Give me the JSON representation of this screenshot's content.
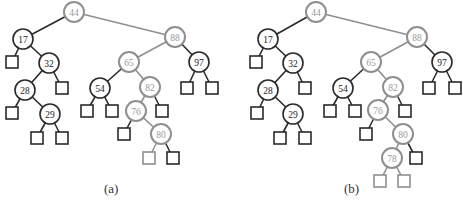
{
  "colors": {
    "dark": "#2a2a2a",
    "highlight": "#8f8f8f",
    "text_dark": "#222222",
    "text_highlight": "#9a9a9a"
  },
  "trees": [
    {
      "caption": "(a)",
      "caption_pos": [
        113,
        190
      ],
      "nodes": [
        {
          "key": "44",
          "x": 74,
          "y": 12,
          "hl": true
        },
        {
          "key": "17",
          "x": 23,
          "y": 39,
          "hl": false
        },
        {
          "key": "32",
          "x": 49,
          "y": 63,
          "hl": false
        },
        {
          "key": "28",
          "x": 25,
          "y": 90,
          "hl": false
        },
        {
          "key": "29",
          "x": 50,
          "y": 114,
          "hl": false
        },
        {
          "key": "88",
          "x": 175,
          "y": 37,
          "hl": true
        },
        {
          "key": "65",
          "x": 129,
          "y": 62,
          "hl": true
        },
        {
          "key": "97",
          "x": 199,
          "y": 62,
          "hl": false
        },
        {
          "key": "54",
          "x": 100,
          "y": 88,
          "hl": false
        },
        {
          "key": "82",
          "x": 150,
          "y": 87,
          "hl": true
        },
        {
          "key": "76",
          "x": 136,
          "y": 111,
          "hl": true
        },
        {
          "key": "80",
          "x": 161,
          "y": 134,
          "hl": true
        }
      ],
      "edges": [
        [
          "44",
          "17",
          false
        ],
        [
          "44",
          "88",
          true
        ],
        [
          "17",
          "32",
          false
        ],
        [
          "32",
          "28",
          false
        ],
        [
          "28",
          "29",
          false
        ],
        [
          "88",
          "65",
          true
        ],
        [
          "88",
          "97",
          false
        ],
        [
          "65",
          "54",
          false
        ],
        [
          "65",
          "82",
          true
        ],
        [
          "82",
          "76",
          true
        ],
        [
          "76",
          "80",
          true
        ]
      ],
      "leaves": [
        {
          "x": 12,
          "y": 62,
          "parent": "17",
          "hl": false
        },
        {
          "x": 62,
          "y": 88,
          "parent": "32",
          "hl": false
        },
        {
          "x": 12,
          "y": 113,
          "parent": "28",
          "hl": false
        },
        {
          "x": 37,
          "y": 138,
          "parent": "29",
          "hl": false
        },
        {
          "x": 62,
          "y": 138,
          "parent": "29",
          "hl": false
        },
        {
          "x": 87,
          "y": 111,
          "parent": "54",
          "hl": false
        },
        {
          "x": 112,
          "y": 111,
          "parent": "54",
          "hl": false
        },
        {
          "x": 162,
          "y": 111,
          "parent": "82",
          "hl": false
        },
        {
          "x": 187,
          "y": 88,
          "parent": "97",
          "hl": false
        },
        {
          "x": 212,
          "y": 88,
          "parent": "97",
          "hl": false
        },
        {
          "x": 124,
          "y": 134,
          "parent": "76",
          "hl": false
        },
        {
          "x": 149,
          "y": 158,
          "parent": "80",
          "hl": true
        },
        {
          "x": 173,
          "y": 158,
          "parent": "80",
          "hl": false
        }
      ]
    },
    {
      "caption": "(b)",
      "caption_pos": [
        353,
        190
      ],
      "nodes": [
        {
          "key": "44",
          "x": 316,
          "y": 12,
          "hl": true
        },
        {
          "key": "17",
          "x": 268,
          "y": 39,
          "hl": false
        },
        {
          "key": "32",
          "x": 293,
          "y": 63,
          "hl": false
        },
        {
          "key": "28",
          "x": 268,
          "y": 90,
          "hl": false
        },
        {
          "key": "29",
          "x": 293,
          "y": 114,
          "hl": false
        },
        {
          "key": "88",
          "x": 417,
          "y": 37,
          "hl": true
        },
        {
          "key": "65",
          "x": 371,
          "y": 62,
          "hl": true
        },
        {
          "key": "97",
          "x": 442,
          "y": 62,
          "hl": false
        },
        {
          "key": "54",
          "x": 343,
          "y": 88,
          "hl": false
        },
        {
          "key": "82",
          "x": 393,
          "y": 87,
          "hl": true
        },
        {
          "key": "76",
          "x": 378,
          "y": 110,
          "hl": true
        },
        {
          "key": "80",
          "x": 403,
          "y": 134,
          "hl": true
        },
        {
          "key": "78",
          "x": 392,
          "y": 158,
          "hl": true
        }
      ],
      "edges": [
        [
          "44",
          "17",
          false
        ],
        [
          "44",
          "88",
          true
        ],
        [
          "17",
          "32",
          false
        ],
        [
          "32",
          "28",
          false
        ],
        [
          "28",
          "29",
          false
        ],
        [
          "88",
          "65",
          true
        ],
        [
          "88",
          "97",
          false
        ],
        [
          "65",
          "54",
          false
        ],
        [
          "65",
          "82",
          true
        ],
        [
          "82",
          "76",
          true
        ],
        [
          "76",
          "80",
          true
        ],
        [
          "80",
          "78",
          true
        ]
      ],
      "leaves": [
        {
          "x": 256,
          "y": 62,
          "parent": "17",
          "hl": false
        },
        {
          "x": 305,
          "y": 88,
          "parent": "32",
          "hl": false
        },
        {
          "x": 257,
          "y": 113,
          "parent": "28",
          "hl": false
        },
        {
          "x": 280,
          "y": 138,
          "parent": "29",
          "hl": false
        },
        {
          "x": 305,
          "y": 138,
          "parent": "29",
          "hl": false
        },
        {
          "x": 330,
          "y": 111,
          "parent": "54",
          "hl": false
        },
        {
          "x": 355,
          "y": 111,
          "parent": "54",
          "hl": false
        },
        {
          "x": 405,
          "y": 111,
          "parent": "82",
          "hl": false
        },
        {
          "x": 429,
          "y": 88,
          "parent": "97",
          "hl": false
        },
        {
          "x": 455,
          "y": 88,
          "parent": "97",
          "hl": false
        },
        {
          "x": 366,
          "y": 134,
          "parent": "76",
          "hl": false
        },
        {
          "x": 416,
          "y": 158,
          "parent": "80",
          "hl": false
        },
        {
          "x": 380,
          "y": 181,
          "parent": "78",
          "hl": true
        },
        {
          "x": 404,
          "y": 181,
          "parent": "78",
          "hl": true
        }
      ]
    }
  ]
}
